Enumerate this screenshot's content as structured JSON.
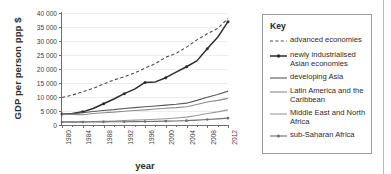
{
  "chart_data": {
    "type": "line",
    "title": "",
    "xlabel": "year",
    "ylabel": "GDP per person ppp $",
    "xlim": [
      1980,
      2012
    ],
    "ylim": [
      0,
      40000
    ],
    "grid": true,
    "legend_position": "right",
    "legend_title": "Key",
    "x_ticks": [
      "1980",
      "1984",
      "1988",
      "1992",
      "1996",
      "2000",
      "2004",
      "2008",
      "2012"
    ],
    "y_ticks": [
      "0",
      "5 000",
      "10 000",
      "15 000",
      "20 000",
      "25 000",
      "30 000",
      "35 000",
      "40 000"
    ],
    "y_tick_values": [
      0,
      5000,
      10000,
      15000,
      20000,
      25000,
      30000,
      35000,
      40000
    ],
    "x": [
      1980,
      1982,
      1984,
      1986,
      1988,
      1990,
      1992,
      1994,
      1996,
      1998,
      2000,
      2002,
      2004,
      2006,
      2008,
      2010,
      2012
    ],
    "series": [
      {
        "name": "advanced economies",
        "style": "dashed",
        "marker": "none",
        "color": "#4a4a4a",
        "values": [
          9800,
          10700,
          11900,
          13100,
          14600,
          16100,
          17200,
          18600,
          20300,
          21900,
          24200,
          25600,
          27800,
          30400,
          32600,
          34500,
          38000
        ]
      },
      {
        "name": "newly industrialised Asian economies",
        "style": "solid",
        "marker": "diamond",
        "color": "#2d2d2d",
        "values": [
          3900,
          4100,
          4700,
          5900,
          7600,
          9300,
          11200,
          12800,
          15200,
          15400,
          16900,
          18900,
          20800,
          22900,
          27200,
          31300,
          36900
        ]
      },
      {
        "name": "developing Asia",
        "style": "solid",
        "marker": "none",
        "color": "#5a5a5a",
        "values": [
          3900,
          4000,
          4350,
          4800,
          5200,
          5500,
          5900,
          6200,
          6500,
          6800,
          7100,
          7400,
          7800,
          8800,
          9900,
          10900,
          12100
        ]
      },
      {
        "name": "Latin America and the Caribbean",
        "style": "solid",
        "marker": "none",
        "color": "#8c8c8c",
        "values": [
          3900,
          3800,
          3650,
          4100,
          4400,
          4600,
          4900,
          5200,
          5400,
          5700,
          6000,
          6200,
          6500,
          7300,
          8200,
          8800,
          9500
        ]
      },
      {
        "name": "Middle East and North Africa",
        "style": "solid",
        "marker": "none",
        "color": "#9a9a9a",
        "values": [
          1100,
          1150,
          1200,
          1250,
          1350,
          1450,
          1600,
          1750,
          1900,
          2050,
          2250,
          2500,
          2800,
          3400,
          4100,
          4700,
          5400
        ]
      },
      {
        "name": "sub-Saharan Africa",
        "style": "solid",
        "marker": "dot",
        "color": "#6f6f6f",
        "values": [
          1050,
          1040,
          1060,
          1080,
          1120,
          1150,
          1180,
          1200,
          1250,
          1300,
          1400,
          1450,
          1550,
          1750,
          1950,
          2200,
          2450
        ]
      }
    ]
  }
}
